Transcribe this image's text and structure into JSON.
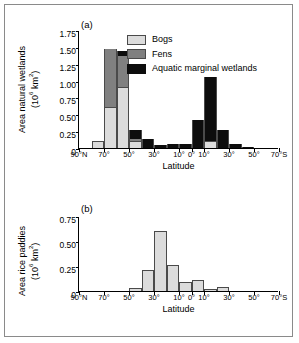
{
  "figure": {
    "panel_a_label": "(a)",
    "panel_b_label": "(b)",
    "x_axis_title": "Latitude"
  },
  "legend": {
    "items": [
      {
        "label": "Bogs",
        "color": "#dcdcdc"
      },
      {
        "label": "Fens",
        "color": "#808080"
      },
      {
        "label": "Aquatic marginal wetlands",
        "color": "#0d0d0d"
      }
    ]
  },
  "chart_data": [
    {
      "type": "bar",
      "title": "(a)",
      "stacked": true,
      "xlabel": "Latitude",
      "ylabel": "Area natural wetlands (10⁶ km²)",
      "ylabel_line1": "Area natural wetlands",
      "ylabel_line2": "(10⁶ km²)",
      "ylim": [
        0,
        1.75
      ],
      "yticks": [
        "0",
        "0.25",
        "0.50",
        "0.75",
        "1.00",
        "1.25",
        "1.50",
        "1.75"
      ],
      "ytick_values": [
        0,
        0.25,
        0.5,
        0.75,
        1.0,
        1.25,
        1.5,
        1.75
      ],
      "xticks": [
        "90°N",
        "70°",
        "50°",
        "30°",
        "10°",
        "0°",
        "10°",
        "30°",
        "50°",
        "70°S"
      ],
      "xtick_positions": [
        0,
        2,
        4,
        6,
        8,
        9,
        10,
        12,
        14,
        16
      ],
      "bin_count": 16,
      "categories": [
        "90-80N",
        "80-70N",
        "70-60N",
        "60-50N",
        "50-40N",
        "40-30N",
        "30-20N",
        "20-10N",
        "10-0N",
        "0-10S",
        "10-20S",
        "20-30S",
        "30-40S",
        "40-50S",
        "50-60S",
        "60-70S"
      ],
      "grid": false,
      "legend_position": "top-right",
      "series": [
        {
          "name": "Bogs",
          "color": "#dcdcdc",
          "values": [
            0,
            0.11,
            0.61,
            0.91,
            0.11,
            0,
            0,
            0,
            0,
            0,
            0.11,
            0,
            0,
            0,
            0,
            0
          ]
        },
        {
          "name": "Fens",
          "color": "#808080",
          "values": [
            0,
            0,
            0.86,
            0.45,
            0.03,
            0,
            0,
            0,
            0,
            0,
            0,
            0,
            0,
            0,
            0,
            0
          ]
        },
        {
          "name": "Aquatic marginal wetlands",
          "color": "#0d0d0d",
          "values": [
            0,
            0,
            0,
            0.08,
            0.13,
            0.13,
            0.04,
            0.06,
            0.06,
            0.42,
            0.94,
            0.27,
            0.06,
            0.02,
            0,
            0
          ]
        }
      ],
      "bar_totals": [
        0,
        0.11,
        1.47,
        1.44,
        0.27,
        0.13,
        0.04,
        0.06,
        0.06,
        0.42,
        1.05,
        0.38,
        0.06,
        0.02,
        0,
        0
      ]
    },
    {
      "type": "bar",
      "title": "(b)",
      "stacked": false,
      "xlabel": "Latitude",
      "ylabel": "Area rice paddies (10⁶ km²)",
      "ylabel_line1": "Area rice paddies",
      "ylabel_line2": "(10⁶ km²)",
      "ylim": [
        0,
        0.75
      ],
      "yticks": [
        "0",
        "0.25",
        "0.50",
        "0.75"
      ],
      "ytick_values": [
        0,
        0.25,
        0.5,
        0.75
      ],
      "xticks": [
        "90°N",
        "70°",
        "50°",
        "30°",
        "10°",
        "0°",
        "10°",
        "30°",
        "50°",
        "70°S"
      ],
      "xtick_positions": [
        0,
        2,
        4,
        6,
        8,
        9,
        10,
        12,
        14,
        16
      ],
      "bin_count": 16,
      "categories": [
        "90-80N",
        "80-70N",
        "70-60N",
        "60-50N",
        "50-40N",
        "40-30N",
        "30-20N",
        "20-10N",
        "10-0N",
        "0-10S",
        "10-20S",
        "20-30S",
        "30-40S",
        "40-50S",
        "50-60S",
        "60-70S"
      ],
      "grid": false,
      "bar_color": "#dcdcdc",
      "values": [
        0,
        0,
        0,
        0,
        0.03,
        0.21,
        0.6,
        0.26,
        0.09,
        0.11,
        0.02,
        0.04,
        0,
        0,
        0,
        0
      ]
    }
  ]
}
